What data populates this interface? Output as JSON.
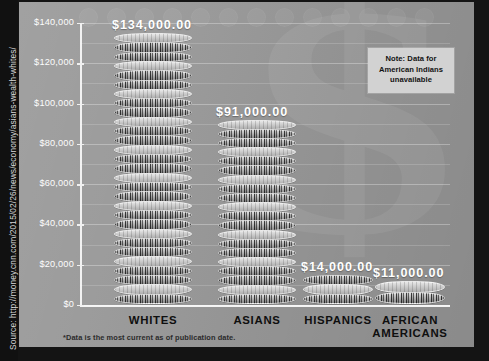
{
  "source": {
    "text": "Source: http://money.cnn.com/2015/02/26/news/economy/asians-wealth-whites/"
  },
  "footnote": {
    "text": "*Data is the most current as of publication date."
  },
  "note": {
    "line1": "Note: Data for",
    "line2": "American Indians",
    "line3": "unavailable"
  },
  "axis": {
    "y_title": "WEALTH",
    "y_ticks": [
      "$140,000",
      "$120,000",
      "$100,000",
      "$80,000",
      "$60,000",
      "$40,000",
      "$20,000",
      "$0"
    ]
  },
  "colors": {
    "panel": "#9a9a9a",
    "frame": "#141414",
    "axis": "#f4f4f4",
    "value_label": "#ffffff",
    "category_label": "#0f0f0f",
    "note_bg": "#d2d2d2"
  },
  "chart_data": {
    "type": "bar",
    "title": "",
    "xlabel": "",
    "ylabel": "WEALTH",
    "categories": [
      "WHITES",
      "ASIANS",
      "HISPANICS",
      "AFRICAN AMERICANS"
    ],
    "values": [
      134000,
      91000,
      14000,
      11000
    ],
    "value_labels": [
      "$134,000.00",
      "$91,000.00",
      "$14,000.00",
      "$11,000.00"
    ],
    "ylim": [
      0,
      140000
    ],
    "ytick_values": [
      0,
      20000,
      40000,
      60000,
      80000,
      100000,
      120000,
      140000
    ],
    "ytick_labels": [
      "$0",
      "$20,000",
      "$40,000",
      "$60,000",
      "$80,000",
      "$100,000",
      "$120,000",
      "$140,000"
    ],
    "grid": true,
    "minor_grid": true,
    "legend": "none",
    "style": "pictorial stacked-coin columns",
    "annotations": [
      "Note: Data for American Indians unavailable",
      "*Data is the most current as of publication date."
    ]
  },
  "cat_lines": {
    "c0": [
      "WHITES"
    ],
    "c1": [
      "ASIANS"
    ],
    "c2": [
      "HISPANICS"
    ],
    "c3": [
      "AFRICAN",
      "AMERICANS"
    ]
  }
}
